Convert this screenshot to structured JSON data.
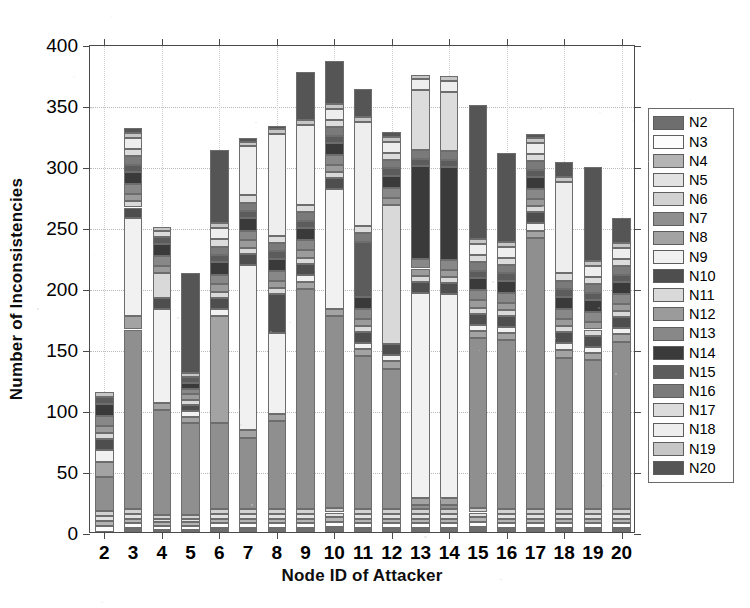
{
  "chart_data": {
    "type": "bar",
    "subtype": "stacked-bar",
    "title": "",
    "xlabel": "Node ID of Attacker",
    "ylabel": "Number of Inconsistencies",
    "xlim": [
      1.5,
      20.5
    ],
    "ylim": [
      0,
      400
    ],
    "yticks": [
      0,
      50,
      100,
      150,
      200,
      250,
      300,
      350,
      400
    ],
    "ytick_labels": [
      "0",
      "50",
      "100",
      "150",
      "200",
      "250",
      "300",
      "350",
      "400"
    ],
    "grid": true,
    "legend_position": "right-outside",
    "categories": [
      "2",
      "3",
      "4",
      "5",
      "6",
      "7",
      "8",
      "9",
      "10",
      "11",
      "12",
      "13",
      "14",
      "15",
      "16",
      "17",
      "18",
      "19",
      "20"
    ],
    "totals": [
      115,
      331,
      250,
      112,
      313,
      343,
      333,
      377,
      392,
      373,
      323,
      369,
      370,
      356,
      315,
      301,
      303,
      299,
      257
    ],
    "series": [
      {
        "name": "N2",
        "color": "#6e6e6e",
        "values": [
          0,
          3,
          2,
          2,
          3,
          3,
          3,
          3,
          4,
          3,
          3,
          3,
          3,
          4,
          3,
          3,
          3,
          3,
          3
        ]
      },
      {
        "name": "N3",
        "color": "#fcfcfc",
        "values": [
          5,
          4,
          3,
          3,
          4,
          4,
          4,
          4,
          4,
          4,
          4,
          4,
          4,
          4,
          4,
          4,
          4,
          4,
          4
        ]
      },
      {
        "name": "N4",
        "color": "#b4b4b4",
        "values": [
          4,
          4,
          3,
          3,
          4,
          4,
          4,
          4,
          4,
          4,
          4,
          4,
          4,
          4,
          4,
          4,
          4,
          4,
          4
        ]
      },
      {
        "name": "N5",
        "color": "#e2e2e2",
        "values": [
          4,
          4,
          3,
          3,
          4,
          4,
          4,
          4,
          4,
          4,
          4,
          4,
          4,
          4,
          4,
          4,
          4,
          4,
          4
        ]
      },
      {
        "name": "N6",
        "color": "#d2d2d2",
        "values": [
          4,
          4,
          3,
          3,
          4,
          4,
          4,
          4,
          4,
          4,
          4,
          4,
          4,
          4,
          4,
          4,
          4,
          4,
          4
        ]
      },
      {
        "name": "N7",
        "color": "#8f8f8f",
        "values": [
          28,
          147,
          86,
          75,
          70,
          58,
          72,
          180,
          157,
          125,
          115,
          3,
          3,
          139,
          138,
          222,
          124,
          122,
          137
        ]
      },
      {
        "name": "N8",
        "color": "#a3a3a3",
        "values": [
          12,
          11,
          6,
          5,
          88,
          7,
          6,
          6,
          6,
          6,
          6,
          6,
          6,
          6,
          6,
          6,
          6,
          6,
          6
        ]
      },
      {
        "name": "N9",
        "color": "#f1f1f1",
        "values": [
          10,
          80,
          77,
          5,
          6,
          135,
          66,
          6,
          98,
          5,
          5,
          168,
          167,
          5,
          5,
          6,
          6,
          5,
          5
        ]
      },
      {
        "name": "N10",
        "color": "#4e4e4e",
        "values": [
          9,
          9,
          9,
          5,
          9,
          9,
          32,
          9,
          9,
          9,
          9,
          9,
          9,
          9,
          9,
          9,
          9,
          9,
          9
        ]
      },
      {
        "name": "N11",
        "color": "#d9d9d9",
        "values": [
          5,
          5,
          20,
          4,
          5,
          5,
          5,
          5,
          5,
          5,
          114,
          5,
          5,
          5,
          5,
          5,
          5,
          5,
          5
        ]
      },
      {
        "name": "N12",
        "color": "#9b9b9b",
        "values": [
          6,
          6,
          6,
          5,
          6,
          6,
          6,
          6,
          6,
          6,
          6,
          6,
          6,
          6,
          6,
          6,
          6,
          6,
          6
        ]
      },
      {
        "name": "N13",
        "color": "#888888",
        "values": [
          8,
          8,
          8,
          4,
          8,
          8,
          8,
          8,
          8,
          8,
          8,
          8,
          8,
          8,
          8,
          8,
          8,
          8,
          8
        ]
      },
      {
        "name": "N14",
        "color": "#3a3a3a",
        "values": [
          10,
          10,
          10,
          5,
          10,
          10,
          10,
          10,
          10,
          10,
          10,
          76,
          76,
          10,
          10,
          10,
          10,
          10,
          10
        ]
      },
      {
        "name": "N15",
        "color": "#5c5c5c",
        "values": [
          6,
          6,
          6,
          5,
          6,
          6,
          6,
          6,
          6,
          45,
          6,
          6,
          6,
          6,
          6,
          6,
          6,
          6,
          6
        ]
      },
      {
        "name": "N16",
        "color": "#7a7a7a",
        "values": [
          0,
          7,
          0,
          0,
          7,
          7,
          7,
          7,
          7,
          7,
          7,
          7,
          7,
          7,
          7,
          7,
          7,
          7,
          7
        ]
      },
      {
        "name": "N17",
        "color": "#dcdcdc",
        "values": [
          0,
          6,
          5,
          0,
          6,
          6,
          6,
          6,
          6,
          6,
          6,
          49,
          49,
          6,
          6,
          6,
          6,
          6,
          6
        ]
      },
      {
        "name": "N18",
        "color": "#eeeeee",
        "values": [
          0,
          9,
          0,
          0,
          9,
          40,
          83,
          66,
          9,
          85,
          9,
          9,
          9,
          9,
          9,
          9,
          75,
          9,
          9
        ]
      },
      {
        "name": "N19",
        "color": "#c6c6c6",
        "values": [
          4,
          4,
          3,
          3,
          4,
          4,
          4,
          4,
          4,
          4,
          4,
          4,
          4,
          4,
          4,
          4,
          4,
          4,
          4
        ]
      },
      {
        "name": "N20",
        "color": "#555555",
        "values": [
          0,
          4,
          0,
          82,
          60,
          3,
          3,
          39,
          35,
          23,
          4,
          0,
          0,
          110,
          73,
          3,
          12,
          77,
          20
        ]
      }
    ]
  },
  "legend": {
    "items": [
      {
        "label": "N2",
        "color": "#6e6e6e"
      },
      {
        "label": "N3",
        "color": "#fcfcfc"
      },
      {
        "label": "N4",
        "color": "#b4b4b4"
      },
      {
        "label": "N5",
        "color": "#e2e2e2"
      },
      {
        "label": "N6",
        "color": "#d2d2d2"
      },
      {
        "label": "N7",
        "color": "#8f8f8f"
      },
      {
        "label": "N8",
        "color": "#a3a3a3"
      },
      {
        "label": "N9",
        "color": "#f1f1f1"
      },
      {
        "label": "N10",
        "color": "#4e4e4e"
      },
      {
        "label": "N11",
        "color": "#d9d9d9"
      },
      {
        "label": "N12",
        "color": "#9b9b9b"
      },
      {
        "label": "N13",
        "color": "#888888"
      },
      {
        "label": "N14",
        "color": "#3a3a3a"
      },
      {
        "label": "N15",
        "color": "#5c5c5c"
      },
      {
        "label": "N16",
        "color": "#7a7a7a"
      },
      {
        "label": "N17",
        "color": "#dcdcdc"
      },
      {
        "label": "N18",
        "color": "#eeeeee"
      },
      {
        "label": "N19",
        "color": "#c6c6c6"
      },
      {
        "label": "N20",
        "color": "#555555"
      }
    ]
  },
  "axes": {
    "y_title": "Number of Inconsistencies",
    "x_title": "Node ID of Attacker"
  }
}
